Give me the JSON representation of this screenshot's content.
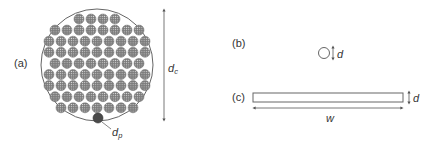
{
  "panels": {
    "a": {
      "label": "(a)",
      "description": "Cross-section of a circular conductor bundle made of many small strands",
      "outer_diameter_label": {
        "main": "d",
        "subscript": "c"
      },
      "strand_diameter_label": {
        "main": "d",
        "subscript": "p"
      },
      "strand_rows": [
        4,
        8,
        9,
        9,
        8,
        9,
        9,
        8,
        7
      ]
    },
    "b": {
      "label": "(b)",
      "description": "Single round wire",
      "diameter_label": "d"
    },
    "c": {
      "label": "(c)",
      "description": "Flat rectangular conductor (foil/strip)",
      "thickness_label": "d",
      "width_label": "w"
    }
  },
  "colors": {
    "line": "#555555",
    "strand_fill": "#8a8a8a",
    "strand_core": "#b5b5b5",
    "highlight_strand": "#444444",
    "text": "#333333"
  }
}
